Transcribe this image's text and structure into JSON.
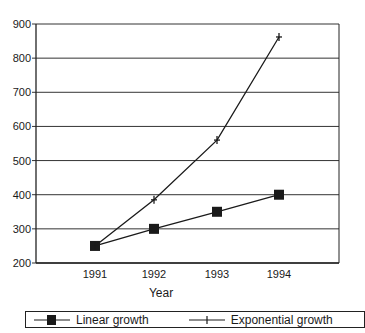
{
  "chart_data": {
    "type": "line",
    "title": "",
    "xlabel": "Year",
    "ylabel": "",
    "categories": [
      "1991",
      "1992",
      "1993",
      "1994"
    ],
    "series": [
      {
        "name": "Linear growth",
        "marker": "square",
        "values": [
          250,
          300,
          350,
          400
        ]
      },
      {
        "name": "Exponential growth",
        "marker": "plus",
        "values": [
          250,
          385,
          560,
          862
        ]
      }
    ],
    "ylim": [
      200,
      900
    ],
    "yticks": [
      200,
      300,
      400,
      500,
      600,
      700,
      800,
      900
    ],
    "grid": true,
    "legend_position": "bottom"
  },
  "legend": {
    "linear_label": "Linear growth",
    "exponential_label": "Exponential growth"
  },
  "colors": {
    "line": "#1a1a1a",
    "background": "#ffffff"
  }
}
